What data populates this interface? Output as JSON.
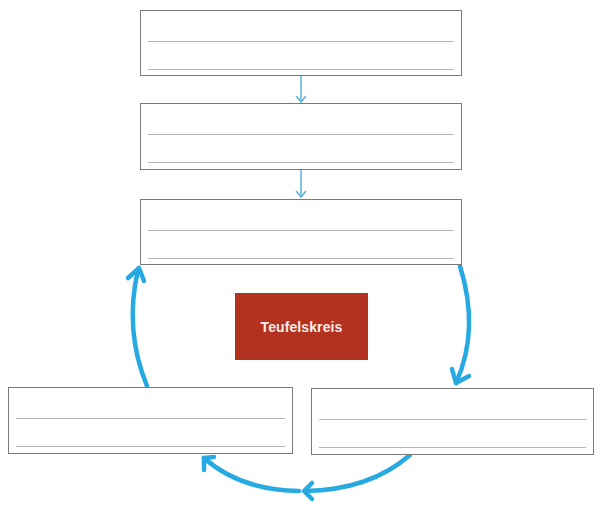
{
  "diagram": {
    "title": "Teufelskreis",
    "colors": {
      "center_box": "#b3311f",
      "center_text": "#f7ebe6",
      "arrow": "#27a9e1",
      "thin_arrow": "#5ab4d6",
      "box_border": "#7a7a7a",
      "write_line": "#b5b5b5"
    },
    "boxes": [
      {
        "id": "box-1",
        "position": "top",
        "lines": 2,
        "text": ""
      },
      {
        "id": "box-2",
        "position": "second",
        "lines": 2,
        "text": ""
      },
      {
        "id": "box-3",
        "position": "third",
        "lines": 2,
        "text": ""
      },
      {
        "id": "box-4",
        "position": "bottom-right",
        "lines": 2,
        "text": ""
      },
      {
        "id": "box-5",
        "position": "bottom-left",
        "lines": 2,
        "text": ""
      }
    ],
    "connections": [
      {
        "from": "box-1",
        "to": "box-2",
        "style": "thin-straight"
      },
      {
        "from": "box-2",
        "to": "box-3",
        "style": "thin-straight"
      },
      {
        "from": "box-3",
        "to": "box-4",
        "style": "thick-curved"
      },
      {
        "from": "box-4",
        "to": "box-5",
        "style": "thick-curved"
      },
      {
        "from": "box-5",
        "to": "box-3",
        "style": "thick-curved"
      }
    ]
  }
}
